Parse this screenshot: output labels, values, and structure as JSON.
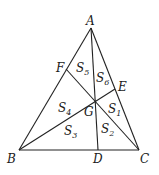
{
  "diagram": {
    "type": "triangle-cevians",
    "points": {
      "A": {
        "x": 91,
        "y": 28
      },
      "B": {
        "x": 19,
        "y": 150
      },
      "C": {
        "x": 139,
        "y": 150
      },
      "D": {
        "x": 98,
        "y": 150
      },
      "E": {
        "x": 115,
        "y": 89
      },
      "F": {
        "x": 66,
        "y": 69
      },
      "G": {
        "x": 95,
        "y": 101
      }
    },
    "vertex_labels": [
      {
        "text": "A",
        "x": 86,
        "y": 25
      },
      {
        "text": "B",
        "x": 7,
        "y": 163
      },
      {
        "text": "C",
        "x": 140,
        "y": 163
      },
      {
        "text": "D",
        "x": 93,
        "y": 163
      },
      {
        "text": "E",
        "x": 119,
        "y": 91
      },
      {
        "text": "F",
        "x": 56,
        "y": 72
      },
      {
        "text": "G",
        "x": 83,
        "y": 116
      }
    ],
    "region_labels": [
      {
        "base": "S",
        "sub": "1",
        "x": 108,
        "y": 113
      },
      {
        "base": "S",
        "sub": "2",
        "x": 100,
        "y": 134
      },
      {
        "base": "S",
        "sub": "3",
        "x": 64,
        "y": 136
      },
      {
        "base": "S",
        "sub": "4",
        "x": 57,
        "y": 112
      },
      {
        "base": "S",
        "sub": "5",
        "x": 75,
        "y": 73
      },
      {
        "base": "S",
        "sub": "6",
        "x": 96,
        "y": 82
      }
    ],
    "segments": [
      [
        "A",
        "B"
      ],
      [
        "B",
        "C"
      ],
      [
        "C",
        "A"
      ],
      [
        "A",
        "D"
      ],
      [
        "B",
        "E"
      ],
      [
        "C",
        "F"
      ]
    ]
  }
}
